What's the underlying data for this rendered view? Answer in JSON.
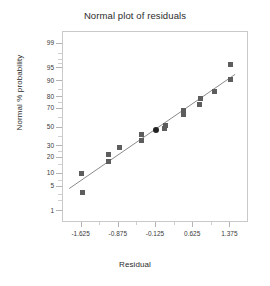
{
  "chart_data": {
    "type": "scatter",
    "title": "Normal plot of residuals",
    "xlabel": "Residual",
    "ylabel": "Normal % probability",
    "grid": false,
    "legend": null,
    "xlim": [
      -2.0,
      1.75
    ],
    "xticks": [
      -1.625,
      -0.875,
      -0.125,
      0.625,
      1.375
    ],
    "xticklabels": [
      "-1.625",
      "-0.875",
      "-0.125",
      "0.625",
      "1.375"
    ],
    "yscale": "normal-probability",
    "ylim": [
      0.4,
      99.6
    ],
    "yticks": [
      99,
      95,
      90,
      80,
      70,
      50,
      30,
      20,
      10,
      5,
      1
    ],
    "yticklabels": [
      "99",
      "95",
      "90",
      "80",
      "70",
      "50",
      "30",
      "20",
      "10",
      "5",
      "1"
    ],
    "points": [
      {
        "x": -1.625,
        "y": 10.0,
        "highlight": false
      },
      {
        "x": -1.61,
        "y": 3.5,
        "highlight": false
      },
      {
        "x": -1.08,
        "y": 23.0,
        "highlight": false
      },
      {
        "x": -1.085,
        "y": 17.0,
        "highlight": false
      },
      {
        "x": -0.86,
        "y": 29.0,
        "highlight": false
      },
      {
        "x": -0.41,
        "y": 42.0,
        "highlight": false
      },
      {
        "x": -0.415,
        "y": 36.0,
        "highlight": false
      },
      {
        "x": -0.125,
        "y": 47.5,
        "highlight": true
      },
      {
        "x": 0.06,
        "y": 52.5,
        "highlight": false
      },
      {
        "x": 0.055,
        "y": 48.5,
        "highlight": false
      },
      {
        "x": 0.43,
        "y": 68.0,
        "highlight": false
      },
      {
        "x": 0.425,
        "y": 64.0,
        "highlight": false
      },
      {
        "x": 0.765,
        "y": 79.0,
        "highlight": false
      },
      {
        "x": 0.76,
        "y": 74.0,
        "highlight": false
      },
      {
        "x": 1.06,
        "y": 84.0,
        "highlight": false
      },
      {
        "x": 1.375,
        "y": 96.0,
        "highlight": false
      },
      {
        "x": 1.37,
        "y": 91.0,
        "highlight": false
      }
    ],
    "fit_line": {
      "type": "reference-line",
      "from": {
        "x": -1.875,
        "y": 4.5
      },
      "to": {
        "x": 1.47,
        "y": 93.0
      },
      "color": "#8a8a8a"
    },
    "marker": {
      "shape": "square",
      "color": "#5d5d5d",
      "size_px": 5
    },
    "highlight_marker": {
      "shape": "circle",
      "color": "#222222",
      "size_px": 6
    }
  }
}
